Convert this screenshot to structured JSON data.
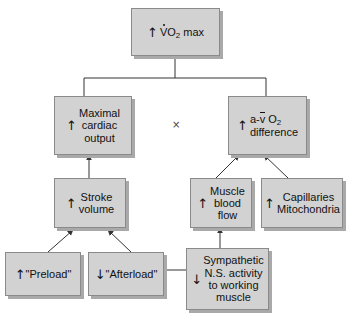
{
  "diagram": {
    "type": "flowchart",
    "background_color": "#ffffff",
    "box_fill_color": "#d2d2d2",
    "box_border_color": "#8a8a8a",
    "box_shadow_color": "#a9a9a9",
    "line_color": "#333333",
    "operator_symbol": "×",
    "nodes": [
      {
        "id": "vo2max",
        "arrow": "↑",
        "text": "VO2 max",
        "text_plain": "↑ V̇O₂ max",
        "level": 0
      },
      {
        "id": "cardiac-output",
        "arrow": "↑",
        "text": "Maximal\ncardiac\noutput",
        "text_plain": "↑ Maximal cardiac output",
        "level": 1
      },
      {
        "id": "avo2-difference",
        "arrow": "↑",
        "text": "a-v O2\ndifference",
        "text_plain": "↑ a-v̄ O₂ difference",
        "level": 1
      },
      {
        "id": "stroke-volume",
        "arrow": "↑",
        "text": "Stroke\nvolume",
        "text_plain": "↑ Stroke volume",
        "level": 2
      },
      {
        "id": "muscle-blood-flow",
        "arrow": "↑",
        "text": "Muscle\nblood\nflow",
        "text_plain": "↑ Muscle blood flow",
        "level": 2
      },
      {
        "id": "capillaries-mitochondria",
        "arrow": "↑",
        "text": "Capillaries\nMitochondria",
        "text_plain": "↑ Capillaries Mitochondria",
        "level": 2
      },
      {
        "id": "preload",
        "arrow": "↑",
        "text": "\"Preload\"",
        "text_plain": "↑ \"Preload\"",
        "level": 3
      },
      {
        "id": "afterload",
        "arrow": "↓",
        "text": "\"Afterload\"",
        "text_plain": "↓ \"Afterload\"",
        "level": 3
      },
      {
        "id": "sympathetic",
        "arrow": "↓",
        "text": "Sympathetic\nN.S. activity\nto working\nmuscle",
        "text_plain": "↓ Sympathetic N.S. activity to working muscle",
        "level": 3
      }
    ],
    "edges": [
      {
        "from": "cardiac-output",
        "to": "vo2max",
        "style": "bus",
        "arrowhead": false
      },
      {
        "from": "avo2-difference",
        "to": "vo2max",
        "style": "bus",
        "arrowhead": false
      },
      {
        "from": "stroke-volume",
        "to": "cardiac-output",
        "style": "vertical",
        "arrowhead": true
      },
      {
        "from": "muscle-blood-flow",
        "to": "avo2-difference",
        "style": "diagonal",
        "arrowhead": true
      },
      {
        "from": "capillaries-mitochondria",
        "to": "avo2-difference",
        "style": "diagonal",
        "arrowhead": true
      },
      {
        "from": "preload",
        "to": "stroke-volume",
        "style": "diagonal",
        "arrowhead": true
      },
      {
        "from": "afterload",
        "to": "stroke-volume",
        "style": "diagonal",
        "arrowhead": true
      },
      {
        "from": "sympathetic",
        "to": "muscle-blood-flow",
        "style": "vertical",
        "arrowhead": true
      },
      {
        "from": "sympathetic",
        "to": "afterload",
        "style": "horizontal",
        "arrowhead": true
      }
    ]
  }
}
